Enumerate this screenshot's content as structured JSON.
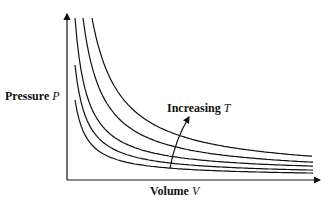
{
  "diagram": {
    "y_axis_label": {
      "text": "Pressure ",
      "var": "P"
    },
    "x_axis_label": {
      "text": "Volume ",
      "var": "V"
    },
    "annotation": {
      "text": "Increasing ",
      "var": "T"
    },
    "isotherm_count": 5,
    "relative_temperatures": [
      1,
      1.4,
      1.9,
      2.5,
      3.3
    ],
    "line_color": "#111111"
  }
}
